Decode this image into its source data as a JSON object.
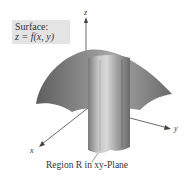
{
  "figure": {
    "surface_label": {
      "title": "Surface:",
      "equation": "z = f(x,  y)"
    },
    "axes": {
      "z": "z",
      "y": "y",
      "x": "x"
    },
    "caption": "Region R in xy-Plane",
    "colors": {
      "surface_dark": "#5a5a5a",
      "surface_light": "#b8b8b8",
      "column_dark": "#6e6e6e",
      "column_light": "#d0d0d0",
      "label_bg": "#e4e4e4",
      "axis": "#444444"
    }
  }
}
